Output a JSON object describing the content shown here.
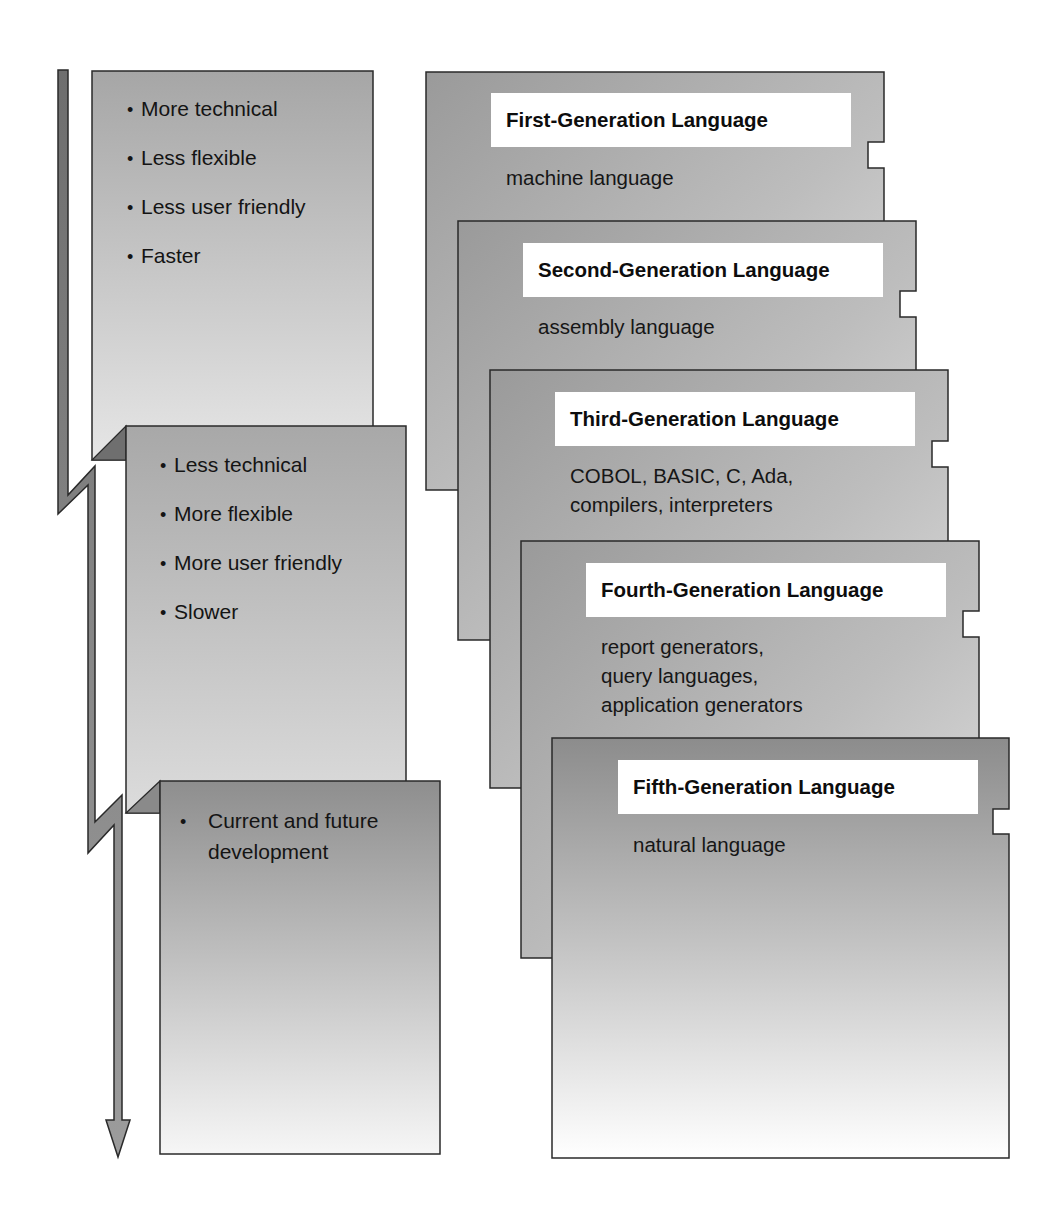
{
  "diagram": {
    "type": "language-generations-evolution",
    "colors": {
      "card_gray_dark": "#8e8e8e",
      "card_gray_light": "#f2f2f2",
      "outline": "#2a2a2a",
      "arrow": "#7a7a7a",
      "fold": "#6f6f6f",
      "title_bg": "#ffffff"
    }
  },
  "characteristics": [
    {
      "items": [
        "More technical",
        "Less flexible",
        "Less user friendly",
        "Faster"
      ]
    },
    {
      "items": [
        "Less technical",
        "More flexible",
        "More user friendly",
        "Slower"
      ]
    },
    {
      "items": [
        "Current  and future development"
      ]
    }
  ],
  "generations": [
    {
      "title": "First-Generation Language",
      "description": "machine language"
    },
    {
      "title": "Second-Generation Language",
      "description": "assembly language"
    },
    {
      "title": "Third-Generation Language",
      "description": "COBOL, BASIC, C, Ada,\ncompilers, interpreters"
    },
    {
      "title": "Fourth-Generation Language",
      "description": "report generators,\nquery languages,\napplication generators"
    },
    {
      "title": "Fifth-Generation Language",
      "description": "natural language"
    }
  ]
}
